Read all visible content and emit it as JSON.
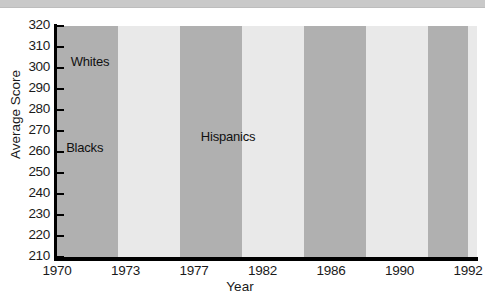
{
  "chart_data": {
    "type": "line",
    "title": "",
    "xlabel": "Year",
    "ylabel": "Average Score",
    "x": [
      1970,
      1973,
      1977,
      1982,
      1986,
      1990,
      1992
    ],
    "xtick_labels": [
      "1970",
      "1973",
      "1977",
      "1982",
      "1986",
      "1990",
      "1992"
    ],
    "ytick_labels": [
      "320",
      "310",
      "300",
      "290",
      "280",
      "270",
      "260",
      "250",
      "240",
      "230",
      "220",
      "210"
    ],
    "ylim": [
      210,
      320
    ],
    "ytick_step": 10,
    "grid": false,
    "legend_position": "inline-labels",
    "background_bands": "alternating vertical gray bands between year ticks",
    "series": [
      {
        "name": "Whites",
        "color": "#8c8c8c",
        "label_x": 1970.6,
        "label_y": 303,
        "x": [
          1970,
          1973,
          1977,
          1982,
          1986,
          1990,
          1992
        ],
        "values": [
          311,
          306,
          300,
          295,
          298,
          301,
          305
        ]
      },
      {
        "name": "Blacks",
        "color": "#1a1a1a",
        "label_x": 1970.4,
        "label_y": 262,
        "x": [
          1970,
          1973,
          1977,
          1982,
          1986,
          1990,
          1992
        ],
        "values": [
          257,
          250,
          240,
          235,
          255,
          255,
          257
        ]
      },
      {
        "name": "Hispanics",
        "color": "#8c8c8c",
        "label_x": 1977.5,
        "label_y": 267,
        "x": [
          1977,
          1982,
          1986,
          1990,
          1992
        ],
        "values": [
          261,
          250,
          261,
          263,
          271
        ]
      }
    ]
  }
}
